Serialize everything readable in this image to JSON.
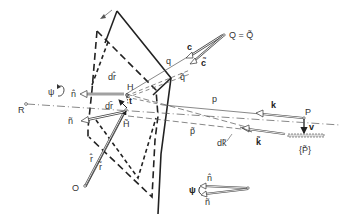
{
  "figure": {
    "type": "geometric-optics-diagram"
  },
  "labels": {
    "Q": "Q = Q̃",
    "c": "c",
    "c_tilde": "c̃",
    "q": "q",
    "q_tilde": "q̃",
    "p": "p",
    "p_tilde": "p̃",
    "k": "k",
    "k_tilde": "k̃",
    "dk": "dk̃",
    "P": "P",
    "P_tilde": "{P̃}",
    "v": "v",
    "R": "R",
    "psi": "ψ",
    "n": "n̂",
    "n_tilde": "ñ",
    "dr_top": "dr̂",
    "dr": "dr̄",
    "H": "H",
    "H_tilde": "H̃",
    "t": "t",
    "r": "r̂",
    "r_tilde": "r̃",
    "O": "O",
    "inset_psi": "ψ",
    "inset_n": "n̂",
    "inset_n_tilde": "ñ"
  },
  "colors": {
    "stroke": "#222222",
    "ray": "#555555",
    "text": "#333333",
    "background": "#ffffff"
  }
}
